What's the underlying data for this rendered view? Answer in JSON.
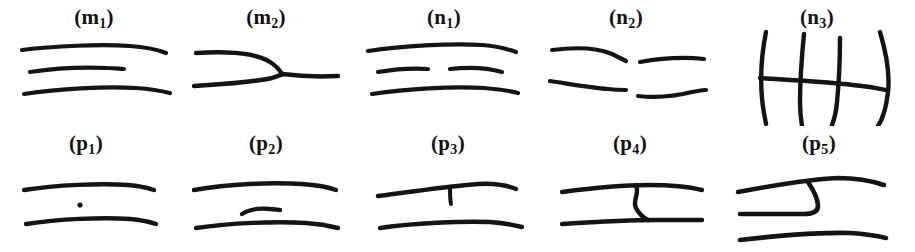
{
  "figure": {
    "background_color": "#ffffff",
    "ink_color": "#141414",
    "width": 915,
    "height": 252,
    "rows": 2,
    "columns": 5
  },
  "panels": [
    {
      "id": "m1",
      "label_text": "(m",
      "label_sub": "1",
      "label_close": ")",
      "row": 1,
      "column": 1,
      "left": 8,
      "width": 172,
      "description": "three roughly horizontal hand-drawn lines, middle line shorter",
      "strokes": [
        {
          "name": "top-line",
          "type": "line",
          "width": 4.2,
          "path": "M 14 24 C 45 20, 92 18, 122 20 C 138 21, 150 24, 158 27"
        },
        {
          "name": "middle-short-line",
          "type": "line",
          "width": 4.2,
          "path": "M 22 46 C 48 42, 78 41, 100 42 C 108 42, 112 43, 116 43"
        },
        {
          "name": "bottom-line",
          "type": "line",
          "width": 4.2,
          "path": "M 16 68 C 50 63, 96 60, 128 62 C 142 63, 154 65, 162 67"
        }
      ]
    },
    {
      "id": "m2",
      "label_text": "(m",
      "label_sub": "2",
      "label_close": ")",
      "row": 1,
      "column": 2,
      "left": 180,
      "width": 172,
      "description": "Y-shaped junction: two lines from the left merge into a single line to the right",
      "strokes": [
        {
          "name": "upper-branch",
          "type": "line",
          "width": 4.4,
          "path": "M 16 27 C 48 25, 76 27, 90 36 C 98 41, 100 45, 102 48"
        },
        {
          "name": "lower-branch",
          "type": "line",
          "width": 4.4,
          "path": "M 14 60 C 46 58, 76 56, 92 52 C 98 50, 101 49, 103 48"
        },
        {
          "name": "merged-trunk",
          "type": "line",
          "width": 4.4,
          "path": "M 102 48 C 118 50, 140 51, 158 50"
        }
      ]
    },
    {
      "id": "n1",
      "label_text": "(n",
      "label_sub": "1",
      "label_close": ")",
      "row": 1,
      "column": 3,
      "left": 358,
      "width": 172,
      "description": "three horizontal lines; the middle line is broken into two segments with a central gap",
      "strokes": [
        {
          "name": "top-line",
          "type": "line",
          "width": 4.2,
          "path": "M 10 25 C 44 20, 92 17, 124 19 C 138 20, 150 23, 158 26"
        },
        {
          "name": "middle-left-segment",
          "type": "line",
          "width": 4.2,
          "path": "M 20 46 C 38 43, 56 42, 70 43"
        },
        {
          "name": "middle-right-segment",
          "type": "line",
          "width": 4.2,
          "path": "M 92 43 C 110 41, 130 42, 144 46"
        },
        {
          "name": "bottom-line",
          "type": "line",
          "width": 4.2,
          "path": "M 14 68 C 48 63, 94 60, 126 62 C 140 63, 152 65, 160 67"
        }
      ]
    },
    {
      "id": "n2",
      "label_text": "(n",
      "label_sub": "2",
      "label_close": ")",
      "row": 1,
      "column": 4,
      "left": 540,
      "width": 172,
      "description": "two broken horizontal lines, each split into a left and a right segment, vertically offset at the breaks",
      "strokes": [
        {
          "name": "upper-left-segment",
          "type": "line",
          "width": 4.2,
          "path": "M 12 24 C 36 21, 58 22, 72 28 C 78 31, 82 33, 86 35"
        },
        {
          "name": "upper-right-segment",
          "type": "line",
          "width": 4.2,
          "path": "M 100 36 C 122 32, 146 31, 164 33"
        },
        {
          "name": "lower-left-segment",
          "type": "line",
          "width": 4.2,
          "path": "M 10 55 C 30 58, 52 62, 68 63 C 76 64, 82 64, 86 64"
        },
        {
          "name": "lower-right-segment",
          "type": "line",
          "width": 4.2,
          "path": "M 98 70 C 116 72, 136 70, 152 66 C 158 65, 162 64, 166 64"
        }
      ]
    },
    {
      "id": "n3",
      "label_text": "(n",
      "label_sub": "3",
      "label_close": ")",
      "row": 1,
      "column": 5,
      "left": 722,
      "width": 190,
      "description": "one horizontal line crossed by four near-vertical lines forming a ladder",
      "strokes": [
        {
          "name": "vertical-line-1",
          "type": "line",
          "width": 4.4,
          "path": "M 44 6 C 40 26, 38 50, 40 72 C 41 84, 43 92, 44 98"
        },
        {
          "name": "vertical-line-2",
          "type": "line",
          "width": 4.4,
          "path": "M 82 8 C 80 28, 78 54, 78 76 C 78 88, 79 94, 80 100"
        },
        {
          "name": "vertical-line-3",
          "type": "line",
          "width": 4.4,
          "path": "M 118 12 C 118 32, 117 56, 115 76 C 114 88, 112 94, 110 99"
        },
        {
          "name": "vertical-line-4",
          "type": "line",
          "width": 4.4,
          "path": "M 158 6 C 164 26, 168 48, 166 66 C 164 84, 160 94, 156 100"
        },
        {
          "name": "horizontal-crossbar",
          "type": "line",
          "width": 4.4,
          "path": "M 38 52 C 70 54, 110 56, 140 60 C 150 61, 158 63, 164 64"
        }
      ]
    },
    {
      "id": "p1",
      "label_text": "(p",
      "label_sub": "1",
      "label_close": ")",
      "row": 2,
      "column": 1,
      "left": 0,
      "width": 172,
      "description": "two horizontal lines with a single small isolated dot between them",
      "strokes": [
        {
          "name": "top-line",
          "type": "line",
          "width": 4.4,
          "path": "M 24 38 C 56 33, 100 31, 128 33 C 140 34, 148 36, 154 38"
        },
        {
          "name": "bottom-line",
          "type": "line",
          "width": 4.4,
          "path": "M 26 72 C 58 67, 102 65, 130 67 C 142 68, 150 70, 156 72"
        }
      ],
      "marks": [
        {
          "name": "isolated-dot",
          "type": "dot",
          "cx": 80,
          "cy": 53,
          "r": 2.6
        }
      ]
    },
    {
      "id": "p2",
      "label_text": "(p",
      "label_sub": "2",
      "label_close": ")",
      "row": 2,
      "column": 2,
      "left": 180,
      "width": 172,
      "description": "two horizontal lines with a short free-floating dash between them",
      "strokes": [
        {
          "name": "top-line",
          "type": "line",
          "width": 4.4,
          "path": "M 14 38 C 48 32, 92 30, 122 32 C 136 33, 148 35, 156 38"
        },
        {
          "name": "middle-short-dash",
          "type": "line",
          "width": 4.4,
          "path": "M 62 62 C 70 57, 80 56, 90 57 C 94 57, 98 58, 100 58"
        },
        {
          "name": "bottom-line",
          "type": "line",
          "width": 4.4,
          "path": "M 16 76 C 50 71, 96 69, 126 71 C 140 72, 150 74, 158 76"
        }
      ]
    },
    {
      "id": "p3",
      "label_text": "(p",
      "label_sub": "3",
      "label_close": ")",
      "row": 2,
      "column": 3,
      "left": 362,
      "width": 172,
      "description": "two horizontal lines; the upper line has a short vertical spur hanging down from it",
      "strokes": [
        {
          "name": "top-line",
          "type": "line",
          "width": 4.4,
          "path": "M 16 44 C 50 40, 86 34, 116 32 C 132 31, 144 33, 154 37"
        },
        {
          "name": "vertical-spur",
          "type": "line",
          "width": 4.0,
          "path": "M 88 35 C 88 42, 88 48, 89 52"
        },
        {
          "name": "bottom-line",
          "type": "line",
          "width": 4.4,
          "path": "M 18 76 C 52 71, 98 69, 128 70 C 142 71, 152 73, 160 75"
        }
      ]
    },
    {
      "id": "p4",
      "label_text": "(p",
      "label_sub": "4",
      "label_close": ")",
      "row": 2,
      "column": 4,
      "left": 544,
      "width": 172,
      "description": "two horizontal lines joined in the middle by a short S-shaped bridge",
      "strokes": [
        {
          "name": "top-line",
          "type": "line",
          "width": 4.4,
          "path": "M 18 40 C 48 36, 78 33, 104 33 C 126 33, 146 35, 158 38"
        },
        {
          "name": "s-bridge",
          "type": "line",
          "width": 4.4,
          "path": "M 92 33 C 96 42, 88 48, 92 56 C 95 62, 100 66, 104 68"
        },
        {
          "name": "bottom-line",
          "type": "line",
          "width": 4.4,
          "path": "M 18 72 C 50 70, 84 68, 112 68 C 132 68, 148 68, 158 68"
        }
      ]
    },
    {
      "id": "p5",
      "label_text": "(p",
      "label_sub": "5",
      "label_close": ")",
      "row": 2,
      "column": 5,
      "left": 726,
      "width": 186,
      "description": "three horizontal lines; the middle line curls upward in a hook to meet the top line",
      "strokes": [
        {
          "name": "top-line",
          "type": "line",
          "width": 4.6,
          "path": "M 12 40 C 44 34, 82 27, 112 26 C 130 26, 146 29, 158 33"
        },
        {
          "name": "middle-line-with-hook",
          "type": "line",
          "width": 4.6,
          "path": "M 14 62 C 40 62, 64 62, 78 62 C 86 62, 92 60, 92 54 C 92 46, 86 36, 82 30"
        },
        {
          "name": "bottom-line",
          "type": "line",
          "width": 4.6,
          "path": "M 14 88 C 48 84, 92 80, 124 81 C 140 82, 152 84, 160 86"
        }
      ]
    }
  ]
}
